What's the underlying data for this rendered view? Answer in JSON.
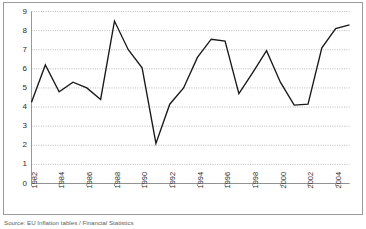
{
  "figure": {
    "source_note": "Source: EU Inflation tables / Financial Statistics",
    "frame_color": "#9a9a9a",
    "background": "#ffffff"
  },
  "chart_data": {
    "type": "line",
    "title": "",
    "subtitle": "",
    "xlabel": "",
    "ylabel": "",
    "x": [
      1982,
      1983,
      1984,
      1985,
      1986,
      1987,
      1988,
      1989,
      1990,
      1991,
      1992,
      1993,
      1994,
      1995,
      1996,
      1997,
      1998,
      1999,
      2000,
      2001,
      2002,
      2003,
      2004,
      2005
    ],
    "values": [
      4.25,
      6.2,
      4.8,
      5.3,
      5.0,
      4.4,
      8.5,
      7.0,
      6.05,
      2.1,
      4.15,
      5.0,
      6.6,
      7.55,
      7.45,
      4.7,
      5.8,
      6.95,
      5.3,
      4.1,
      4.15,
      7.1,
      8.1,
      8.3
    ],
    "series": [
      {
        "name": "series-1",
        "color": "#181818",
        "values": [
          4.25,
          6.2,
          4.8,
          5.3,
          5.0,
          4.4,
          8.5,
          7.0,
          6.05,
          2.1,
          4.15,
          5.0,
          6.6,
          7.55,
          7.45,
          4.7,
          5.8,
          6.95,
          5.3,
          4.1,
          4.15,
          7.1,
          8.1,
          8.3
        ]
      }
    ],
    "xlim": [
      1982,
      2005
    ],
    "ylim": [
      0,
      9
    ],
    "yticks": [
      0,
      1,
      2,
      3,
      4,
      5,
      6,
      7,
      8,
      9
    ],
    "ytick_labels": [
      "0",
      "1",
      "2",
      "3",
      "4",
      "5",
      "6",
      "7",
      "8",
      "9"
    ],
    "xticks": [
      1982,
      1984,
      1986,
      1988,
      1990,
      1992,
      1994,
      1996,
      1998,
      2000,
      2002,
      2004
    ],
    "xtick_labels": [
      "1982",
      "1984",
      "1986",
      "1988",
      "1990",
      "1992",
      "1994",
      "1996",
      "1998",
      "2000",
      "2002",
      "2004"
    ],
    "xtick_rotation": -90,
    "grid": true,
    "grid_axis": "y",
    "grid_style": "dotted",
    "grid_color": "#8f8f8f",
    "legend": false,
    "legend_position": "none",
    "annotations": []
  }
}
